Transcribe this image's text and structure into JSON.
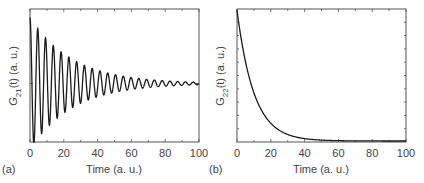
{
  "chart_data": [
    {
      "type": "line",
      "panel_label": "(a)",
      "title": "",
      "xlabel": "Time (a. u.)",
      "ylabel": "G21(t) (a. u.)",
      "ylabel_parts": {
        "base": "G",
        "sub": "21",
        "arg": "(t)",
        "unit": " (a. u.)"
      },
      "xlim": [
        0,
        100
      ],
      "xticks": [
        "0",
        "20",
        "40",
        "60",
        "80",
        "100"
      ],
      "yticks": [],
      "grid": false,
      "legend": null,
      "description": "Damped oscillation centered at zero; period ≈ 4.6 a.u., envelope decay constant ≈ 25 a.u.",
      "series": [
        {
          "name": "G21(t)",
          "model": "A*exp(-t/25)*cos(2*pi*t/4.6)",
          "x": [
            0,
            2.3,
            4.6,
            6.9,
            9.2,
            11.5,
            13.8,
            16.1,
            18.4,
            20.7,
            23.0,
            27.6,
            32.2,
            36.8,
            41.4,
            46.0,
            55.2,
            64.4,
            73.6,
            82.8,
            92.0,
            100
          ],
          "values": [
            1.0,
            -0.91,
            0.83,
            -0.76,
            0.69,
            -0.63,
            0.58,
            -0.52,
            0.48,
            -0.44,
            0.4,
            0.33,
            0.28,
            0.23,
            0.19,
            0.16,
            0.11,
            0.08,
            0.05,
            0.04,
            0.03,
            0.02
          ]
        }
      ]
    },
    {
      "type": "line",
      "panel_label": "(b)",
      "title": "",
      "xlabel": "Time (a. u.)",
      "ylabel": "G22(t) (a. u.)",
      "ylabel_parts": {
        "base": "G",
        "sub": "22",
        "arg": "(t)",
        "unit": " (a. u.)"
      },
      "xlim": [
        0,
        100
      ],
      "xticks": [
        "0",
        "20",
        "40",
        "60",
        "80",
        "100"
      ],
      "yticks": [],
      "grid": false,
      "legend": null,
      "description": "Monotonic exponential decay from maximum at t=0 to ~0 by t≈50; decay constant ≈ 10 a.u.",
      "series": [
        {
          "name": "G22(t)",
          "model": "exp(-t/10)",
          "x": [
            0,
            5,
            10,
            15,
            20,
            25,
            30,
            40,
            50,
            60,
            80,
            100
          ],
          "values": [
            1.0,
            0.61,
            0.37,
            0.22,
            0.14,
            0.08,
            0.05,
            0.02,
            0.007,
            0.002,
            0.0,
            0.0
          ]
        }
      ]
    }
  ],
  "colors": {
    "line": "#1a1a1a",
    "axis": "#555555",
    "text": "#444444"
  }
}
